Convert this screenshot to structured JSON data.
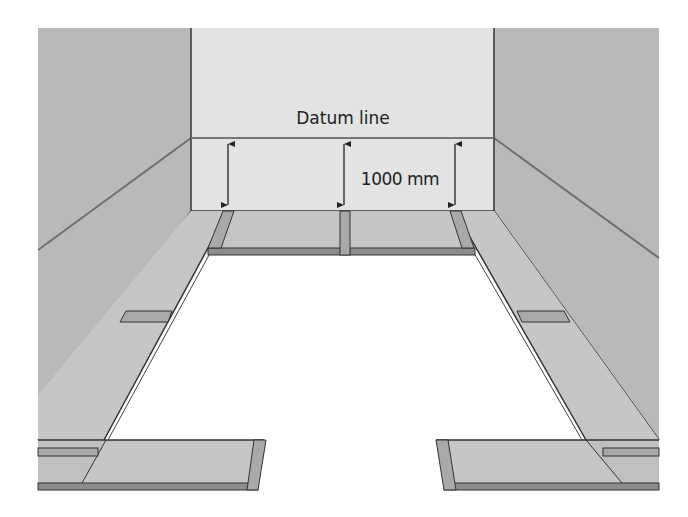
{
  "diagram": {
    "labels": {
      "datum_line": "Datum line",
      "dimension": "1000 mm"
    },
    "colors": {
      "side_wall": "#b9b9b9",
      "back_wall": "#e3e3e3",
      "floor_strip_top": "#c6c6c6",
      "floor_strip_edge": "#8c8c8c",
      "joint": "#a9a9a9",
      "line": "#333333",
      "datum_line": "#777777"
    },
    "elements": {
      "back_wall": "Back wall with datum line",
      "left_wall": "Left side wall",
      "right_wall": "Right side wall",
      "dimension_arrows": 3,
      "floor_strips": [
        "back strip",
        "left strip",
        "right strip",
        "front-left strip",
        "front-right strip"
      ]
    }
  }
}
